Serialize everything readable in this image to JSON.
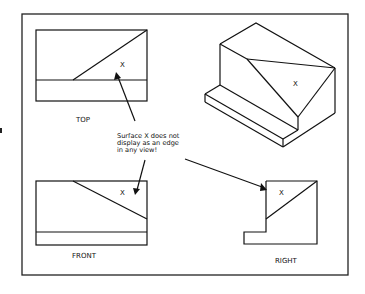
{
  "figure": {
    "views": {
      "top": {
        "label": "TOP",
        "surface_label": "X"
      },
      "front": {
        "label": "FRONT",
        "surface_label": "X"
      },
      "right": {
        "label": "RIGHT",
        "surface_label": "X"
      },
      "isometric": {
        "surface_label": "X"
      }
    },
    "annotation": {
      "lines": [
        "Surface X does not",
        "display as an edge",
        "in any view!"
      ]
    },
    "colors": {
      "line": "#111111",
      "background": "#ffffff"
    }
  }
}
